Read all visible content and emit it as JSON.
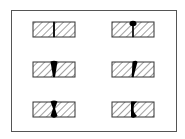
{
  "diagram": {
    "type": "weld-joint-cross-sections",
    "frame": {
      "x": 11,
      "y": 10,
      "w": 165,
      "h": 121,
      "stroke": "#555555"
    },
    "colors": {
      "plate_stroke": "#333333",
      "hatch": "#444444",
      "weld": "#000000",
      "background": "#ffffff"
    },
    "layout": {
      "rows": 3,
      "cols": 2
    },
    "joints": [
      {
        "id": "joint-1",
        "row": 1,
        "col": 1,
        "description": "square butt joint, no weld (root gap only)"
      },
      {
        "id": "joint-2",
        "row": 1,
        "col": 2,
        "description": "butt weld with top bead, partial penetration"
      },
      {
        "id": "joint-3",
        "row": 2,
        "col": 1,
        "description": "V-shaped weld, full penetration tapering downward"
      },
      {
        "id": "joint-4",
        "row": 2,
        "col": 2,
        "description": "single bevel weld, slanted penetration"
      },
      {
        "id": "joint-5",
        "row": 3,
        "col": 1,
        "description": "double-sided weld, top and bottom beads (hourglass)"
      },
      {
        "id": "joint-6",
        "row": 3,
        "col": 2,
        "description": "single bevel with back bead, curved fusion"
      }
    ]
  }
}
